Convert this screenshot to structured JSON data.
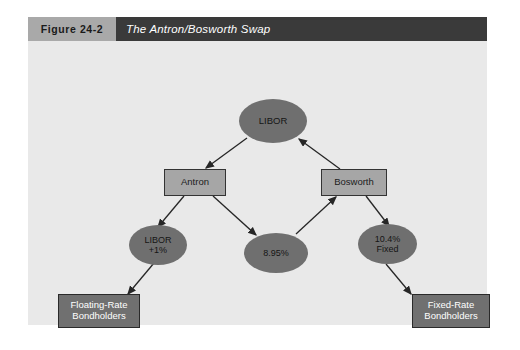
{
  "figure": {
    "number": "Figure 24-2",
    "title": "The Antron/Bosworth Swap"
  },
  "colors": {
    "page_background": "#ffffff",
    "panel_background": "#e9e9e9",
    "figure_number_bg": "#a9a9a9",
    "figure_title_bg": "#3a3a3a",
    "box_fill": "#a6a6a6",
    "box_dark_fill": "#707070",
    "ellipse_fill": "#6f6f6f",
    "stroke": "#2a2a2a"
  },
  "diagram": {
    "type": "swap-flow-diagram",
    "nodes": [
      {
        "id": "libor",
        "shape": "ellipse",
        "label_lines": [
          "LIBOR"
        ],
        "has_dashed_arc": true
      },
      {
        "id": "antron",
        "shape": "box",
        "label_lines": [
          "Antron"
        ],
        "has_dashed_arc": false
      },
      {
        "id": "bosworth",
        "shape": "box",
        "label_lines": [
          "Bosworth"
        ],
        "has_dashed_arc": false
      },
      {
        "id": "libor_plus_1",
        "shape": "ellipse",
        "label_lines": [
          "LIBOR",
          "+1%"
        ],
        "has_dashed_arc": true
      },
      {
        "id": "rate_8_95",
        "shape": "ellipse",
        "label_lines": [
          "8.95%"
        ],
        "has_dashed_arc": true
      },
      {
        "id": "fixed_10_4",
        "shape": "ellipse",
        "label_lines": [
          "10.4%",
          "Fixed"
        ],
        "has_dashed_arc": true
      },
      {
        "id": "floating_bh",
        "shape": "box-dark",
        "label_lines": [
          "Floating-Rate",
          "Bondholders"
        ],
        "has_dashed_arc": false
      },
      {
        "id": "fixed_bh",
        "shape": "box-dark",
        "label_lines": [
          "Fixed-Rate",
          "Bondholders"
        ],
        "has_dashed_arc": false
      }
    ],
    "edges": [
      {
        "from": "libor",
        "to": "antron"
      },
      {
        "from": "bosworth",
        "to": "libor"
      },
      {
        "from": "antron",
        "to": "libor_plus_1"
      },
      {
        "from": "antron",
        "to": "rate_8_95"
      },
      {
        "from": "rate_8_95",
        "to": "bosworth"
      },
      {
        "from": "bosworth",
        "to": "fixed_10_4"
      },
      {
        "from": "libor_plus_1",
        "to": "floating_bh"
      },
      {
        "from": "fixed_10_4",
        "to": "fixed_bh"
      }
    ]
  },
  "labels": {
    "libor": "LIBOR",
    "antron": "Antron",
    "bosworth": "Bosworth",
    "libor_plus_1_line1": "LIBOR",
    "libor_plus_1_line2": "+1%",
    "rate_8_95": "8.95%",
    "fixed_10_4_line1": "10.4%",
    "fixed_10_4_line2": "Fixed",
    "floating_bh_line1": "Floating-Rate",
    "floating_bh_line2": "Bondholders",
    "fixed_bh_line1": "Fixed-Rate",
    "fixed_bh_line2": "Bondholders"
  }
}
